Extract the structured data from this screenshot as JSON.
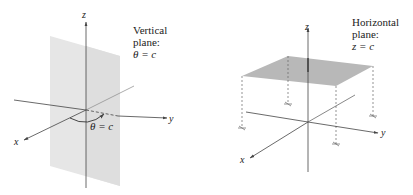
{
  "left_figure": {
    "title": "Vertical plane",
    "caption_lines": [
      "Vertical",
      "plane:",
      "θ = c"
    ],
    "angle_label": "θ = c",
    "axes": {
      "x": "x",
      "y": "y",
      "z": "z"
    }
  },
  "right_figure": {
    "title": "Horizontal plane",
    "caption_lines": [
      "Horizontal",
      "plane:",
      "z = c"
    ],
    "axes": {
      "x": "x",
      "y": "y",
      "z": "z"
    }
  },
  "colors": {
    "vertical_plane_fill": "#e4e4e4",
    "horizontal_plane_fill": "#b5b5b5",
    "axis_stroke": "#444444"
  }
}
